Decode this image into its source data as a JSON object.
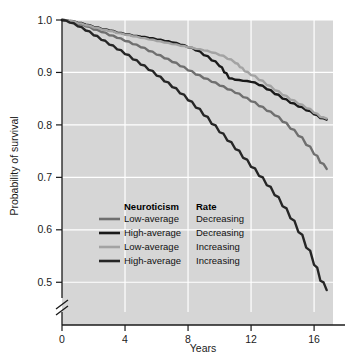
{
  "chart_data": {
    "type": "line",
    "title": "",
    "xlabel": "Years",
    "ylabel": "Probability of survival",
    "xlim": [
      0,
      17.2
    ],
    "ylim": [
      0.47,
      1.0
    ],
    "xticks": [
      0,
      4,
      8,
      12,
      16
    ],
    "xtick_labels": [
      "0",
      "4",
      "8",
      "12",
      "16"
    ],
    "yticks": [
      0.5,
      0.6,
      0.7,
      0.8,
      0.9,
      1.0
    ],
    "ytick_labels": [
      "0.5",
      "0.6",
      "0.7",
      "0.8",
      "0.9",
      "1.0"
    ],
    "grid": true,
    "grid_color": "#ffffff",
    "plot_background": "#d6d6d6",
    "axis_break": true,
    "axis_break_note": "y-axis broken below 0.5",
    "legend_position": "inside-lower-left",
    "legend_columns": [
      "Neuroticism",
      "Rate"
    ],
    "series": [
      {
        "name": "Low-average Decreasing",
        "neuroticism": "Low-average",
        "rate": "Decreasing",
        "color": "#6f6f6f",
        "x": [
          0,
          0.5,
          1,
          1.5,
          2,
          2.5,
          3,
          3.5,
          4,
          4.5,
          5,
          5.5,
          6,
          6.5,
          7,
          7.5,
          8,
          8.5,
          9,
          9.5,
          10,
          10.5,
          11,
          11.5,
          12,
          12.5,
          13,
          13.5,
          14,
          14.5,
          15,
          15.5,
          16,
          16.4,
          16.8
        ],
        "y": [
          1.0,
          0.997,
          0.993,
          0.988,
          0.982,
          0.977,
          0.971,
          0.966,
          0.96,
          0.954,
          0.948,
          0.941,
          0.934,
          0.927,
          0.92,
          0.912,
          0.904,
          0.896,
          0.889,
          0.882,
          0.875,
          0.868,
          0.861,
          0.853,
          0.845,
          0.836,
          0.827,
          0.818,
          0.806,
          0.793,
          0.779,
          0.762,
          0.744,
          0.728,
          0.716
        ]
      },
      {
        "name": "High-average Decreasing",
        "neuroticism": "High-average",
        "rate": "Decreasing",
        "color": "#1a1a1a",
        "x": [
          0,
          0.5,
          1,
          1.5,
          2,
          2.5,
          3,
          3.5,
          4,
          4.5,
          5,
          5.5,
          6,
          6.5,
          7,
          7.5,
          8,
          8.5,
          9,
          9.5,
          10,
          10.3,
          10.6,
          11,
          11.5,
          12,
          12.5,
          13,
          13.5,
          14,
          14.5,
          15,
          15.5,
          16,
          16.4,
          16.8
        ],
        "y": [
          1.0,
          0.998,
          0.995,
          0.991,
          0.987,
          0.983,
          0.98,
          0.976,
          0.973,
          0.97,
          0.968,
          0.966,
          0.963,
          0.96,
          0.957,
          0.953,
          0.948,
          0.942,
          0.933,
          0.923,
          0.912,
          0.9,
          0.889,
          0.886,
          0.884,
          0.882,
          0.876,
          0.868,
          0.859,
          0.85,
          0.842,
          0.835,
          0.828,
          0.82,
          0.813,
          0.81
        ]
      },
      {
        "name": "Low-average Increasing",
        "neuroticism": "Low-average",
        "rate": "Increasing",
        "color": "#a3a3a3",
        "x": [
          0,
          0.5,
          1,
          1.5,
          2,
          2.5,
          3,
          3.5,
          4,
          4.5,
          5,
          5.5,
          6,
          6.5,
          7,
          7.5,
          8,
          8.5,
          9,
          9.5,
          10,
          10.5,
          11,
          11.3,
          11.6,
          12,
          12.5,
          13,
          13.5,
          14,
          14.5,
          15,
          15.5,
          16,
          16.4,
          16.8
        ],
        "y": [
          1.0,
          0.998,
          0.994,
          0.99,
          0.986,
          0.982,
          0.979,
          0.975,
          0.972,
          0.969,
          0.966,
          0.963,
          0.96,
          0.957,
          0.954,
          0.951,
          0.948,
          0.945,
          0.942,
          0.938,
          0.933,
          0.926,
          0.918,
          0.91,
          0.902,
          0.895,
          0.886,
          0.876,
          0.866,
          0.857,
          0.848,
          0.84,
          0.832,
          0.823,
          0.815,
          0.812
        ]
      },
      {
        "name": "High-average Increasing",
        "neuroticism": "High-average",
        "rate": "Increasing",
        "color": "#262626",
        "x": [
          0,
          0.5,
          1,
          1.5,
          2,
          2.5,
          3,
          3.5,
          4,
          4.5,
          5,
          5.5,
          6,
          6.5,
          7,
          7.5,
          8,
          8.5,
          9,
          9.5,
          10,
          10.5,
          11,
          11.5,
          12,
          12.5,
          13,
          13.5,
          14,
          14.5,
          15,
          15.5,
          16,
          16.4,
          16.8
        ],
        "y": [
          1.0,
          0.995,
          0.988,
          0.98,
          0.971,
          0.962,
          0.953,
          0.944,
          0.935,
          0.925,
          0.915,
          0.905,
          0.894,
          0.883,
          0.872,
          0.86,
          0.847,
          0.833,
          0.818,
          0.802,
          0.786,
          0.77,
          0.754,
          0.737,
          0.72,
          0.703,
          0.685,
          0.666,
          0.645,
          0.622,
          0.596,
          0.566,
          0.533,
          0.503,
          0.485
        ]
      }
    ]
  },
  "legend": {
    "header_neuroticism": "Neuroticism",
    "header_rate": "Rate",
    "rows": [
      {
        "neuroticism": "Low-average",
        "rate": "Decreasing"
      },
      {
        "neuroticism": "High-average",
        "rate": "Decreasing"
      },
      {
        "neuroticism": "Low-average",
        "rate": "Increasing"
      },
      {
        "neuroticism": "High-average",
        "rate": "Increasing"
      }
    ]
  },
  "axes": {
    "y_title": "Probability of survival",
    "x_title": "Years",
    "ytick_0": "1.0",
    "ytick_1": "0.9",
    "ytick_2": "0.8",
    "ytick_3": "0.7",
    "ytick_4": "0.6",
    "ytick_5": "0.5",
    "xtick_0": "0",
    "xtick_1": "4",
    "xtick_2": "8",
    "xtick_3": "12",
    "xtick_4": "16"
  }
}
